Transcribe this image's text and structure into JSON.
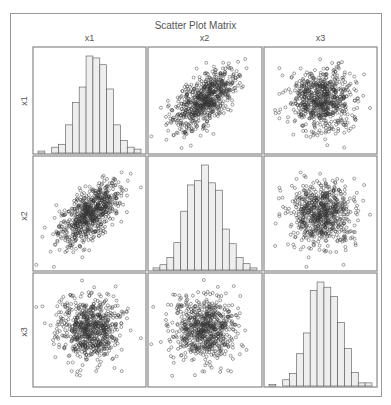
{
  "chart_data": {
    "type": "scatter_matrix",
    "title": "Scatter Plot Matrix",
    "variables": [
      "x1",
      "x2",
      "x3"
    ],
    "diagonal": "histogram",
    "n_points_approx": 1000,
    "histograms": {
      "x1": {
        "bins": 15,
        "relative_heights": [
          0.02,
          0,
          0.06,
          0.09,
          0.29,
          0.52,
          0.68,
          1.0,
          0.98,
          0.91,
          0.66,
          0.29,
          0.13,
          0.06,
          0.04
        ]
      },
      "x2": {
        "bins": 15,
        "relative_heights": [
          0.02,
          0.05,
          0.12,
          0.26,
          0.56,
          0.81,
          0.85,
          1.0,
          0.83,
          0.76,
          0.39,
          0.25,
          0.12,
          0.06,
          0.02
        ]
      },
      "x3": {
        "bins": 15,
        "relative_heights": [
          0.01,
          0,
          0.06,
          0.12,
          0.31,
          0.51,
          0.92,
          1.0,
          0.95,
          0.86,
          0.61,
          0.36,
          0.13,
          0.03,
          0.03
        ]
      }
    },
    "correlations_approx": {
      "x1_x2": 0.6,
      "x1_x3": 0.0,
      "x2_x3": 0.0
    },
    "marker": "open-circle",
    "colors": {
      "frame": "#999999",
      "panel_border": "#888888",
      "bar_fill": "#eeeeee",
      "bar_edge": "#555555",
      "point": "#333333"
    }
  },
  "labels": {
    "title": "Scatter Plot Matrix",
    "columns": [
      "x1",
      "x2",
      "x3"
    ],
    "rows": [
      "x1",
      "x2",
      "x3"
    ]
  }
}
